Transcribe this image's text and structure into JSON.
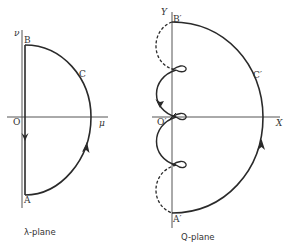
{
  "figure": {
    "panels": [
      {
        "id": "lambda-plane",
        "caption": "λ-plane",
        "axes": {
          "vertical": "ν",
          "horizontal": "μ",
          "origin": "O"
        },
        "points": {
          "A": "A",
          "B": "B",
          "C": "C"
        }
      },
      {
        "id": "q-plane",
        "caption": "Q-plane",
        "axes": {
          "vertical": "Y",
          "horizontal": "X",
          "origin": "O′"
        },
        "points": {
          "A": "A′",
          "B": "B′",
          "C": "C′"
        }
      }
    ],
    "colors": {
      "stroke": "#2a2a2a",
      "axis": "#555555",
      "background": "#ffffff"
    }
  }
}
